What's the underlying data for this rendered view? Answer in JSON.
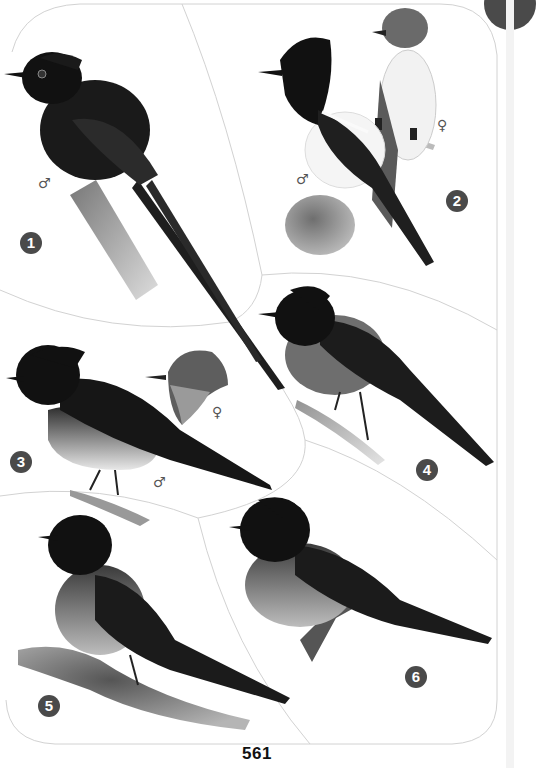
{
  "page": {
    "number": "561",
    "accent_color": "#4a4a4a",
    "panel_line_color": "#cfcfcf"
  },
  "figures": [
    {
      "id": 1,
      "label": "1",
      "subject": "long-tailed dark flycatcher on stump",
      "sex_symbols": [
        "♂"
      ]
    },
    {
      "id": 2,
      "label": "2",
      "subject": "crested pied flycatcher pair on branch",
      "sex_symbols": [
        "♂",
        "♀"
      ]
    },
    {
      "id": 3,
      "label": "3",
      "subject": "crested flycatcher with female head inset",
      "sex_symbols": [
        "♀",
        "♂"
      ]
    },
    {
      "id": 4,
      "label": "4",
      "subject": "dark-capped flycatcher on mossy twig",
      "sex_symbols": []
    },
    {
      "id": 5,
      "label": "5",
      "subject": "dark flycatcher on mossy branch",
      "sex_symbols": []
    },
    {
      "id": 6,
      "label": "6",
      "subject": "dark flycatcher on broken branch",
      "sex_symbols": []
    }
  ],
  "icons": {
    "male": "♂",
    "female": "♀"
  }
}
